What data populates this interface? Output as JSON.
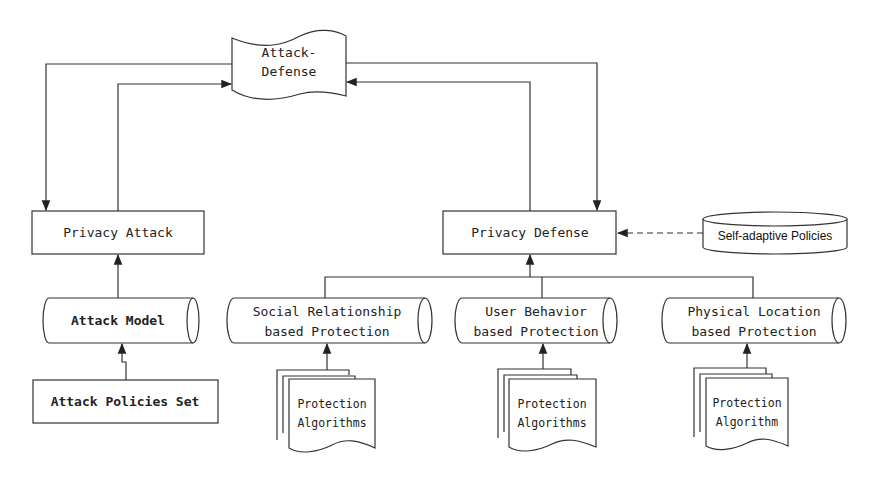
{
  "diagram": {
    "colors": {
      "line": "#333333",
      "text": "#222222",
      "background": "#ffffff"
    },
    "nodes": {
      "attack_defense": {
        "line1": "Attack-",
        "line2": "Defense",
        "shape": "wave-document"
      },
      "privacy_attack": {
        "label": "Privacy Attack",
        "shape": "rectangle"
      },
      "privacy_defense": {
        "label": "Privacy Defense",
        "shape": "rectangle"
      },
      "self_adaptive": {
        "label": "Self-adaptive Policies",
        "shape": "database-cylinder"
      },
      "attack_model": {
        "label": "Attack Model",
        "shape": "horizontal-cylinder"
      },
      "attack_policies": {
        "label": "Attack Policies Set",
        "shape": "rectangle"
      },
      "social": {
        "line1": "Social Relationship",
        "line2": "based Protection",
        "shape": "horizontal-cylinder"
      },
      "user_behavior": {
        "line1": "User Behavior",
        "line2": "based Protection",
        "shape": "horizontal-cylinder"
      },
      "physical_location": {
        "line1": "Physical Location",
        "line2": "based Protection",
        "shape": "horizontal-cylinder"
      },
      "algo_social": {
        "line1": "Protection",
        "line2": "Algorithms",
        "shape": "multi-document"
      },
      "algo_user": {
        "line1": "Protection",
        "line2": "Algorithms",
        "shape": "multi-document"
      },
      "algo_physical": {
        "line1": "Protection",
        "line2": "Algorithm",
        "shape": "multi-document"
      }
    },
    "edges": [
      {
        "from": "attack_defense",
        "to": "privacy_attack"
      },
      {
        "from": "privacy_attack",
        "to": "attack_defense"
      },
      {
        "from": "attack_defense",
        "to": "privacy_defense"
      },
      {
        "from": "privacy_defense",
        "to": "attack_defense"
      },
      {
        "from": "self_adaptive",
        "to": "privacy_defense",
        "style": "dashed"
      },
      {
        "from": "attack_model",
        "to": "privacy_attack"
      },
      {
        "from": "attack_policies",
        "to": "attack_model"
      },
      {
        "from": "social",
        "to": "privacy_defense"
      },
      {
        "from": "user_behavior",
        "to": "privacy_defense"
      },
      {
        "from": "physical_location",
        "to": "privacy_defense"
      },
      {
        "from": "algo_social",
        "to": "social"
      },
      {
        "from": "algo_user",
        "to": "user_behavior"
      },
      {
        "from": "algo_physical",
        "to": "physical_location"
      }
    ]
  }
}
